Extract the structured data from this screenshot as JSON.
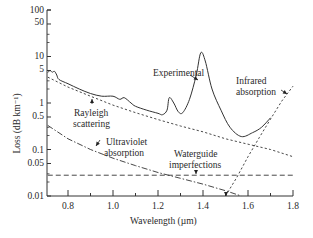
{
  "chart_data": {
    "type": "line",
    "title": "",
    "xlabel": "Wavelength (µm)",
    "ylabel": "Loss (dB km⁻¹)",
    "xlim": [
      0.707,
      1.8
    ],
    "ylim": [
      0.01,
      100
    ],
    "yscale": "log",
    "grid": false,
    "x_ticks": [
      "0.8",
      "1.0",
      "1.2",
      "1.4",
      "1.6",
      "1.8"
    ],
    "y_ticks": [
      "100",
      "50",
      "10",
      "5",
      "1",
      "0.5",
      "0.1",
      "0.05",
      "0.01"
    ],
    "series": [
      {
        "name": "Experimental",
        "style": "solid",
        "x": [
          0.71,
          0.72,
          0.73,
          0.74,
          0.75,
          0.76,
          0.8,
          0.85,
          0.9,
          0.95,
          1.0,
          1.03,
          1.05,
          1.08,
          1.1,
          1.15,
          1.2,
          1.22,
          1.24,
          1.25,
          1.27,
          1.29,
          1.31,
          1.34,
          1.37,
          1.39,
          1.41,
          1.44,
          1.48,
          1.52,
          1.57,
          1.62,
          1.66,
          1.7
        ],
        "y": [
          4.5,
          5.0,
          4.6,
          4.8,
          4.0,
          3.2,
          2.6,
          2.0,
          1.6,
          1.4,
          1.4,
          1.2,
          1.3,
          1.0,
          0.85,
          0.7,
          0.6,
          0.56,
          0.7,
          1.3,
          1.0,
          0.65,
          0.62,
          1.2,
          4.0,
          12.0,
          8.0,
          2.0,
          0.7,
          0.3,
          0.19,
          0.23,
          0.3,
          0.48
        ]
      },
      {
        "name": "Rayleigh scattering",
        "style": "dotted",
        "x": [
          0.71,
          0.8,
          0.9,
          1.0,
          1.1,
          1.2,
          1.3,
          1.4,
          1.5,
          1.6,
          1.7,
          1.8
        ],
        "y": [
          3.6,
          2.2,
          1.4,
          0.9,
          0.62,
          0.44,
          0.32,
          0.24,
          0.17,
          0.13,
          0.1,
          0.07
        ]
      },
      {
        "name": "Ultraviolet absorption",
        "style": "dashdot",
        "x": [
          0.71,
          0.8,
          0.9,
          1.0,
          1.1,
          1.2,
          1.3,
          1.4,
          1.5,
          1.57
        ],
        "y": [
          0.33,
          0.17,
          0.1,
          0.065,
          0.045,
          0.032,
          0.024,
          0.018,
          0.013,
          0.01
        ]
      },
      {
        "name": "Waveguide imperfections",
        "style": "dashed",
        "x": [
          0.71,
          1.8
        ],
        "y": [
          0.028,
          0.028
        ]
      },
      {
        "name": "Infrared absorption",
        "style": "dotted",
        "x": [
          1.5,
          1.55,
          1.6,
          1.65,
          1.7,
          1.75,
          1.8
        ],
        "y": [
          0.01,
          0.025,
          0.07,
          0.18,
          0.45,
          1.1,
          2.3
        ]
      }
    ],
    "annotations": [
      {
        "text": "Experimental",
        "x": 1.3,
        "y": 5.5
      },
      {
        "text": "Infrared absorption",
        "x": 1.6,
        "y": 3.5
      },
      {
        "text": "Rayleigh scattering",
        "x": 0.85,
        "y": 0.45
      },
      {
        "text": "Ultraviolet absorption",
        "x": 1.0,
        "y": 0.1
      },
      {
        "text": "Waveguide imperfections",
        "x": 1.3,
        "y": 0.06
      }
    ]
  },
  "labels": {
    "experimental": "Experimental",
    "infrared_1": "Infrared",
    "infrared_2": "absorption",
    "rayleigh_1": "Rayleigh",
    "rayleigh_2": "scattering",
    "uv_1": "Ultraviolet",
    "uv_2": "absorption",
    "wg_1": "Waterguide",
    "wg_2": "imperfections"
  },
  "axes": {
    "xlabel": "Wavelength (µm)",
    "ylabel": "Loss (dB km⁻¹)",
    "x_ticks": [
      "0.8",
      "1.0",
      "1.2",
      "1.4",
      "1.6",
      "1.8"
    ],
    "y_ticks": [
      "100",
      "50",
      "10",
      "5",
      "1",
      "0.5",
      "0.1",
      "0.05",
      "0.01"
    ]
  }
}
